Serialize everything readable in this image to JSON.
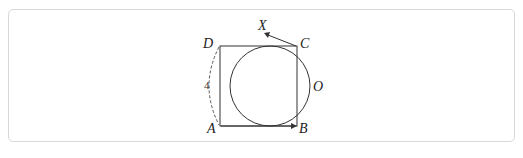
{
  "figure": {
    "points": {
      "A": "A",
      "B": "B",
      "C": "C",
      "D": "D",
      "X": "X",
      "O": "O"
    },
    "side_length_label": "4",
    "colors": {
      "stroke": "#333333",
      "frame": "#d8d8d8"
    }
  }
}
